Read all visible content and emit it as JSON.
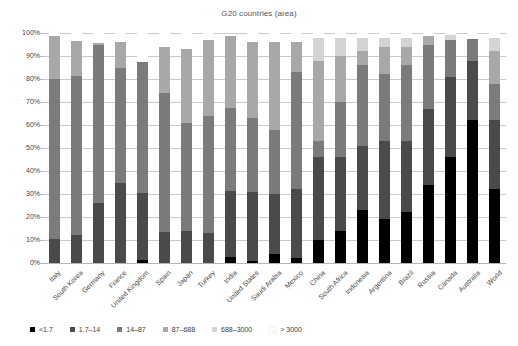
{
  "chart_data": {
    "type": "bar",
    "subtype": "stacked-percentage-column",
    "title": "G20 countries (area)",
    "xlabel": "",
    "ylabel": "",
    "ylim": [
      0,
      100
    ],
    "ytick_labels": [
      "0%",
      "10%",
      "20%",
      "30%",
      "40%",
      "50%",
      "60%",
      "70%",
      "80%",
      "90%",
      "100%"
    ],
    "ytick_values": [
      0,
      10,
      20,
      30,
      40,
      50,
      60,
      70,
      80,
      90,
      100
    ],
    "grid": true,
    "legend_position": "bottom-left",
    "legend": [
      "<1.7",
      "1.7–14",
      "14–87",
      "87–688",
      "688–3000",
      "> 3000"
    ],
    "series_colors": [
      "#000000",
      "#4a4a4a",
      "#7b7b7b",
      "#a8a8a8",
      "#d4d4d4",
      "#ffffff"
    ],
    "categories": [
      "Italy",
      "South Korea",
      "Germany",
      "France",
      "United Kingdom",
      "Spain",
      "Japan",
      "Turkey",
      "India",
      "United States",
      "Saudi Arabia",
      "Mexico",
      "China",
      "South Africa",
      "Indonesia",
      "Argentina",
      "Brazil",
      "Russia",
      "Canada",
      "Australia",
      "World"
    ],
    "series": [
      {
        "name": "<1.7",
        "values": [
          0,
          0,
          0,
          0,
          1.5,
          0,
          0,
          0,
          2.5,
          1,
          4,
          2,
          10,
          14,
          23,
          19,
          22,
          34,
          46,
          62,
          32
        ]
      },
      {
        "name": "1.7–14",
        "values": [
          10.5,
          12,
          26,
          35,
          29,
          13.5,
          14,
          13,
          29,
          30,
          26,
          30,
          36,
          32,
          28,
          34,
          31,
          33,
          35,
          26,
          30
        ]
      },
      {
        "name": "14–87",
        "values": [
          69.5,
          69.5,
          69,
          50,
          57,
          60.5,
          47,
          51,
          36,
          32,
          28,
          51,
          7,
          24,
          35,
          29,
          33,
          28,
          16,
          9.5,
          16
        ]
      },
      {
        "name": "87–688",
        "values": [
          18.5,
          15,
          0.5,
          11,
          0,
          20,
          32,
          33,
          31,
          33,
          38,
          13,
          35,
          20,
          6,
          12,
          8,
          3.5,
          0,
          0,
          14
        ]
      },
      {
        "name": "688–3000",
        "values": [
          0,
          0,
          0,
          0,
          0,
          0,
          0,
          0,
          0,
          0,
          0,
          0,
          10,
          8,
          6,
          4,
          4,
          0,
          2,
          0,
          6
        ]
      },
      {
        "name": "> 3000",
        "values": [
          1.5,
          3.5,
          4.5,
          4,
          12.5,
          6,
          7,
          3,
          1,
          4,
          4,
          4,
          2,
          2,
          2,
          2,
          2,
          1.5,
          1,
          2.5,
          2
        ]
      }
    ]
  },
  "legend": {
    "items": [
      {
        "label": "<1.7",
        "color": "#000000"
      },
      {
        "label": "1.7–14",
        "color": "#4a4a4a"
      },
      {
        "label": "14–87",
        "color": "#7b7b7b"
      },
      {
        "label": "87–688",
        "color": "#a8a8a8"
      },
      {
        "label": "688–3000",
        "color": "#d4d4d4"
      },
      {
        "label": "> 3000",
        "color": "#ffffff"
      }
    ]
  }
}
